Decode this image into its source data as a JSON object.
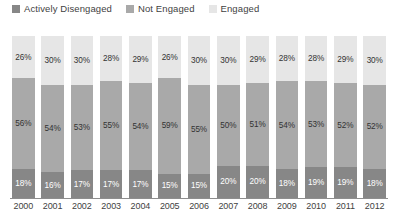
{
  "chart_data": {
    "type": "bar",
    "title": "",
    "subtitle": "",
    "xlabel": "",
    "ylabel": "",
    "ylim": [
      0,
      100
    ],
    "grid": false,
    "stacked": true,
    "stack_total": 100,
    "units": "%",
    "legend_position": "top-left",
    "legend": [
      "Actively Disengaged",
      "Not Engaged",
      "Engaged"
    ],
    "categories": [
      "2000",
      "2001",
      "2002",
      "2003",
      "2004",
      "2005",
      "2006",
      "2007",
      "2008",
      "2009",
      "2010",
      "2011",
      "2012"
    ],
    "series": [
      {
        "name": "Engaged",
        "color": "#e6e6e6",
        "label_color": "#333333",
        "values": [
          26,
          30,
          30,
          28,
          29,
          26,
          30,
          30,
          29,
          28,
          28,
          29,
          30
        ],
        "labels": [
          "26%",
          "30%",
          "30%",
          "28%",
          "29%",
          "26%",
          "30%",
          "30%",
          "29%",
          "28%",
          "28%",
          "29%",
          "30%"
        ]
      },
      {
        "name": "Not Engaged",
        "color": "#a9a9a9",
        "label_color": "#333333",
        "values": [
          56,
          54,
          53,
          55,
          54,
          59,
          55,
          50,
          51,
          54,
          53,
          52,
          52
        ],
        "labels": [
          "56%",
          "54%",
          "53%",
          "55%",
          "54%",
          "59%",
          "55%",
          "50%",
          "51%",
          "54%",
          "53%",
          "52%",
          "52%"
        ]
      },
      {
        "name": "Actively Disengaged",
        "color": "#878787",
        "label_color": "#ffffff",
        "values": [
          18,
          16,
          17,
          17,
          17,
          15,
          15,
          20,
          20,
          18,
          19,
          19,
          18
        ],
        "labels": [
          "18%",
          "16%",
          "17%",
          "17%",
          "17%",
          "15%",
          "15%",
          "20%",
          "20%",
          "18%",
          "19%",
          "19%",
          "18%"
        ]
      }
    ]
  },
  "legend": {
    "items": [
      {
        "label": "Actively Disengaged",
        "color": "#878787",
        "swatch_name": "legend-swatch-actively-disengaged"
      },
      {
        "label": "Not Engaged",
        "color": "#a9a9a9",
        "swatch_name": "legend-swatch-not-engaged"
      },
      {
        "label": "Engaged",
        "color": "#e6e6e6",
        "swatch_name": "legend-swatch-engaged"
      }
    ]
  },
  "colors": {
    "actively_disengaged": "#878787",
    "not_engaged": "#a9a9a9",
    "engaged": "#e6e6e6",
    "axis": "#8e8e8e",
    "text": "#3f3f3f",
    "background": "#ffffff"
  }
}
